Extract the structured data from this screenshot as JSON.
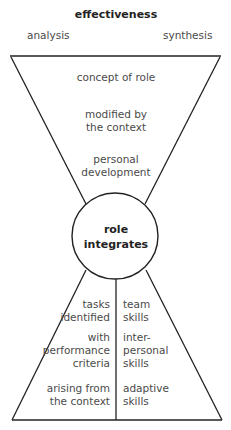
{
  "header": {
    "title": "effectiveness",
    "left_label": "analysis",
    "right_label": "synthesis"
  },
  "upper_funnel": {
    "items": [
      "concept of role",
      "modified by\nthe context",
      "personal\ndevelopment"
    ]
  },
  "center": {
    "label": "role\nintegrates"
  },
  "lower_left": {
    "items": [
      "tasks\nidentified",
      "with\nperformance\ncriteria",
      "arising from\nthe context"
    ]
  },
  "lower_right": {
    "items": [
      "team\nskills",
      "inter-\npersonal\nskills",
      "adaptive\nskills"
    ]
  },
  "colors": {
    "line": "#222222",
    "text": "#4a4a4a"
  }
}
